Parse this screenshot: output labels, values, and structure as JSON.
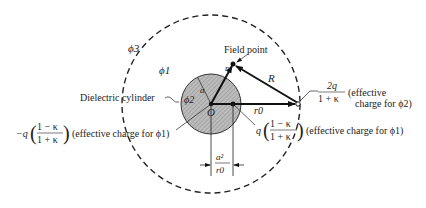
{
  "figure": {
    "labels": {
      "phi3": "ϕ3",
      "phi1": "ϕ1",
      "phi2": "ϕ2",
      "field_point": "Field point",
      "dielectric": "Dielectric cylinder",
      "a": "a",
      "r": "r",
      "R": "R",
      "O": "O",
      "r0": "r0",
      "a2_over_r0_num": "a²",
      "a2_over_r0_den": "r0"
    },
    "charges": {
      "outer_num": "2q",
      "outer_den": "1 + κ",
      "outer_note_1": "(effective",
      "outer_note_2": "charge for ϕ2)",
      "image_prefix": "q",
      "image_num": "1 − κ",
      "image_den": "1 + κ",
      "image_note": "(effective charge for ϕ1)",
      "center_prefix": "−q",
      "center_num": "1 − κ",
      "center_den": "1 + κ",
      "center_note": "(effective charge for ϕ1)"
    }
  }
}
